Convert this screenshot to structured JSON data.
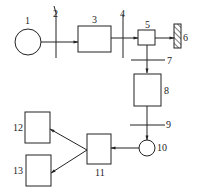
{
  "diagram": {
    "stroke_color": "#222222",
    "background": "#ffffff",
    "labels": {
      "n1": "1",
      "n2": "2",
      "n3": "3",
      "n4": "4",
      "n5": "5",
      "n6": "6",
      "n7": "7",
      "n8": "8",
      "n9": "9",
      "n10": "10",
      "n11": "11",
      "n12": "12",
      "n13": "13"
    },
    "nodes": [
      {
        "id": "1",
        "shape": "circle"
      },
      {
        "id": "2",
        "shape": "plane-line"
      },
      {
        "id": "3",
        "shape": "rectangle"
      },
      {
        "id": "4",
        "shape": "plane-line"
      },
      {
        "id": "5",
        "shape": "rectangle"
      },
      {
        "id": "6",
        "shape": "hatched-rectangle"
      },
      {
        "id": "7",
        "shape": "plane-line"
      },
      {
        "id": "8",
        "shape": "rectangle"
      },
      {
        "id": "9",
        "shape": "plane-line"
      },
      {
        "id": "10",
        "shape": "circle"
      },
      {
        "id": "11",
        "shape": "rectangle"
      },
      {
        "id": "12",
        "shape": "rectangle"
      },
      {
        "id": "13",
        "shape": "rectangle"
      }
    ],
    "edges": [
      {
        "from": "1",
        "to": "3"
      },
      {
        "from": "3",
        "to": "5"
      },
      {
        "from": "5",
        "to": "6"
      },
      {
        "from": "5",
        "to": "8"
      },
      {
        "from": "8",
        "to": "10"
      },
      {
        "from": "10",
        "to": "11"
      },
      {
        "from": "11",
        "to": "12"
      },
      {
        "from": "11",
        "to": "13"
      }
    ]
  }
}
